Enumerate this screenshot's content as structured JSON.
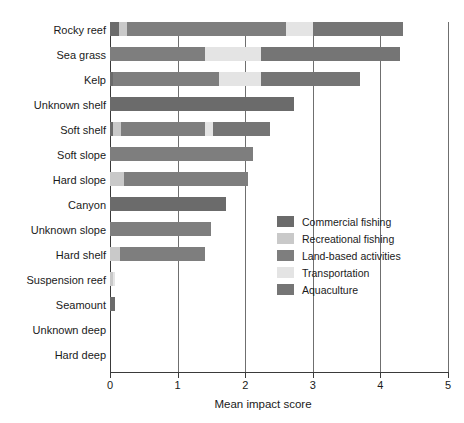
{
  "chart_data": {
    "type": "bar",
    "orientation": "horizontal",
    "stacked": true,
    "title": "",
    "xlabel": "Mean impact score",
    "ylabel": "",
    "xlim": [
      0,
      5
    ],
    "xticks": [
      0,
      1,
      2,
      3,
      4,
      5
    ],
    "xtick_labels": [
      "0",
      "1",
      "2",
      "3",
      "4",
      "5"
    ],
    "grid": "vertical",
    "legend_position": "center-right",
    "categories": [
      "Rocky reef",
      "Sea grass",
      "Kelp",
      "Unknown shelf",
      "Soft shelf",
      "Soft slope",
      "Hard slope",
      "Canyon",
      "Unknown slope",
      "Hard shelf",
      "Suspension reef",
      "Seamount",
      "Unknown deep",
      "Hard deep"
    ],
    "series": [
      {
        "name": "Commercial fishing",
        "color": "#6b6b6b",
        "values": [
          0.13,
          0.0,
          0.05,
          2.72,
          0.04,
          0.0,
          0.0,
          1.72,
          0.0,
          0.0,
          0.0,
          0.07,
          0.0,
          0.0
        ]
      },
      {
        "name": "Recreational fishing",
        "color": "#c9c9c9",
        "values": [
          0.12,
          0.0,
          0.0,
          0.0,
          0.12,
          0.0,
          0.21,
          0.0,
          0.0,
          0.15,
          0.04,
          0.0,
          0.0,
          0.0
        ]
      },
      {
        "name": "Land-based activities",
        "color": "#7e7e7e",
        "values": [
          2.35,
          1.4,
          1.56,
          0.0,
          1.25,
          2.12,
          1.83,
          0.0,
          1.5,
          1.26,
          0.0,
          0.0,
          0.0,
          0.0
        ]
      },
      {
        "name": "Transportation",
        "color": "#e4e4e4",
        "values": [
          0.4,
          0.84,
          0.62,
          0.0,
          0.12,
          0.0,
          0.0,
          0.0,
          0.0,
          0.0,
          0.04,
          0.0,
          0.0,
          0.0
        ]
      },
      {
        "name": "Aquaculture",
        "color": "#757575",
        "values": [
          1.33,
          2.05,
          1.47,
          0.0,
          0.84,
          0.0,
          0.0,
          0.0,
          0.0,
          0.0,
          0.0,
          0.0,
          0.0,
          0.0
        ]
      }
    ],
    "totals": [
      4.33,
      4.29,
      3.7,
      2.72,
      2.37,
      2.12,
      2.04,
      1.72,
      1.5,
      1.41,
      0.08,
      0.07,
      0.0,
      0.0
    ]
  },
  "legend": {
    "items": [
      {
        "label": "Commercial fishing",
        "color": "#6b6b6b"
      },
      {
        "label": "Recreational fishing",
        "color": "#c9c9c9"
      },
      {
        "label": "Land-based activities",
        "color": "#7e7e7e"
      },
      {
        "label": "Transportation",
        "color": "#e4e4e4"
      },
      {
        "label": "Aquaculture",
        "color": "#757575"
      }
    ]
  },
  "axis": {
    "x_title": "Mean impact score"
  }
}
